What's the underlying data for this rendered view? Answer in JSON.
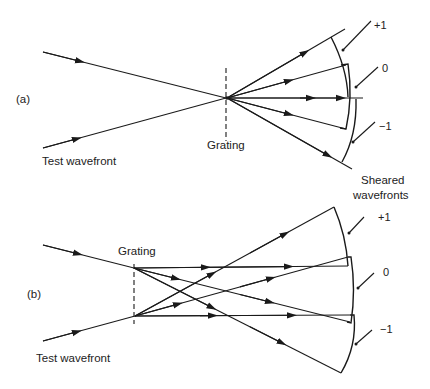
{
  "figure": {
    "panel_a": {
      "panel_label": "(a)",
      "input_label": "Test wavefront",
      "grating_label": "Grating",
      "output_label_line1": "Sheared",
      "output_label_line2": "wavefronts",
      "orders": [
        "+1",
        "0",
        "−1"
      ]
    },
    "panel_b": {
      "panel_label": "(b)",
      "input_label": "Test wavefront",
      "grating_label": "Grating",
      "orders": [
        "+1",
        "0",
        "−1"
      ]
    }
  }
}
